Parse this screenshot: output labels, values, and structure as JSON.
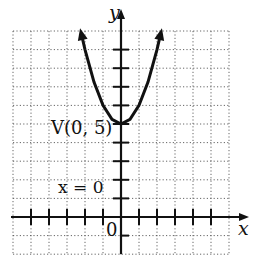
{
  "chart_data": {
    "type": "line",
    "title": "",
    "xlabel": "x",
    "ylabel": "y",
    "xlim": [
      -6,
      6
    ],
    "ylim": [
      -2,
      10
    ],
    "grid": true,
    "grid_style": "dotted",
    "function": "y = x^2 + 5",
    "series": [
      {
        "name": "parabola",
        "x": [
          -2.2,
          -2,
          -1.5,
          -1,
          -0.5,
          0,
          0.5,
          1,
          1.5,
          2,
          2.2
        ],
        "y": [
          9.84,
          9,
          7.25,
          6,
          5.25,
          5,
          5.25,
          6,
          7.25,
          9,
          9.84
        ]
      }
    ],
    "annotations": [
      {
        "text": "V(0, 5)",
        "x": 0,
        "y": 5,
        "role": "vertex"
      },
      {
        "text": "x = 0",
        "role": "axis of symmetry"
      },
      {
        "text": "0",
        "role": "origin"
      }
    ],
    "tick_marks": {
      "x": [
        -5,
        -4,
        -3,
        -2,
        -1,
        1,
        2,
        3,
        4,
        5
      ],
      "y": [
        1,
        2,
        3,
        4,
        5,
        6,
        7,
        8,
        9
      ]
    }
  },
  "labels": {
    "x_axis": "x",
    "y_axis": "y",
    "vertex": "V(0, 5)",
    "axis_of_symmetry": "x = 0",
    "origin": "0"
  }
}
